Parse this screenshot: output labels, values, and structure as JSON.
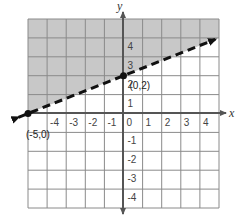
{
  "chart_data": {
    "type": "line",
    "title": "",
    "xlabel": "x",
    "ylabel": "y",
    "xlim": [
      -5,
      5
    ],
    "ylim": [
      -5,
      5
    ],
    "grid": true,
    "x_ticks": [
      -4,
      -3,
      -2,
      -1,
      0,
      1,
      2,
      3,
      4
    ],
    "y_ticks": [
      4,
      3,
      2,
      1,
      -1,
      -2,
      -3,
      -4
    ],
    "series": [
      {
        "name": "boundary line y = 0.4x + 2",
        "style": "dashed",
        "slope": 0.4,
        "intercept": 2,
        "x": [
          -5.5,
          4.8
        ],
        "y": [
          -0.2,
          3.92
        ]
      }
    ],
    "shaded_region": "above the line (y > 0.4x + 2)",
    "points": [
      {
        "label": "(0,2)",
        "x": 0,
        "y": 2
      },
      {
        "label": "(-5,0)",
        "x": -5,
        "y": 0
      }
    ],
    "colors": {
      "shade": "#c8c8c8",
      "grid": "#8a8a8a",
      "axis": "#555555",
      "line": "#111111"
    }
  }
}
